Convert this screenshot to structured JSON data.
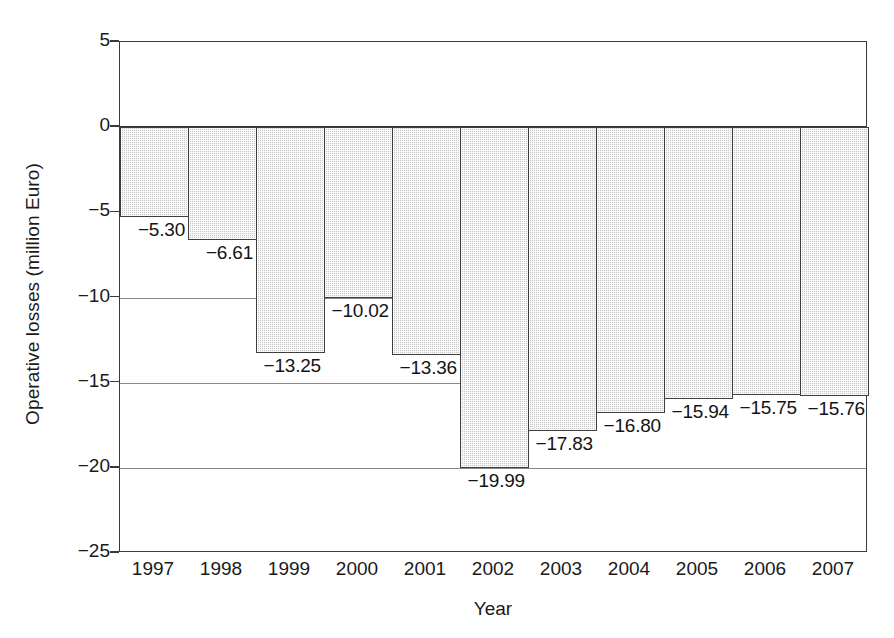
{
  "chart_data": {
    "type": "bar",
    "title": "",
    "xlabel": "Year",
    "ylabel": "Operative losses (million Euro)",
    "categories": [
      "1997",
      "1998",
      "1999",
      "2000",
      "2001",
      "2002",
      "2003",
      "2004",
      "2005",
      "2006",
      "2007"
    ],
    "values": [
      -5.3,
      -6.61,
      -13.25,
      -10.02,
      -13.36,
      -19.99,
      -17.83,
      -16.8,
      -15.94,
      -15.75,
      -15.76
    ],
    "data_labels": [
      "−5.30",
      "−6.61",
      "−13.25",
      "−10.02",
      "−13.36",
      "−19.99",
      "−17.83",
      "−16.80",
      "−15.94",
      "−15.75",
      "−15.76"
    ],
    "ylim": [
      -25,
      5
    ],
    "yticks": [
      5,
      0,
      -5,
      -10,
      -15,
      -20,
      -25
    ],
    "ytick_labels": [
      "5",
      "0",
      "−5",
      "−10",
      "−15",
      "−20",
      "−25"
    ],
    "grid": true,
    "grid_axis": "y",
    "legend": "none",
    "bar_fill_color": "#c8c8c8",
    "bar_edge_color": "#3f3f3f",
    "axis_color": "#3a3a3a",
    "gridline_color": "#8a8a8a",
    "zero_line_color": "#333333",
    "background_color": "#ffffff"
  }
}
